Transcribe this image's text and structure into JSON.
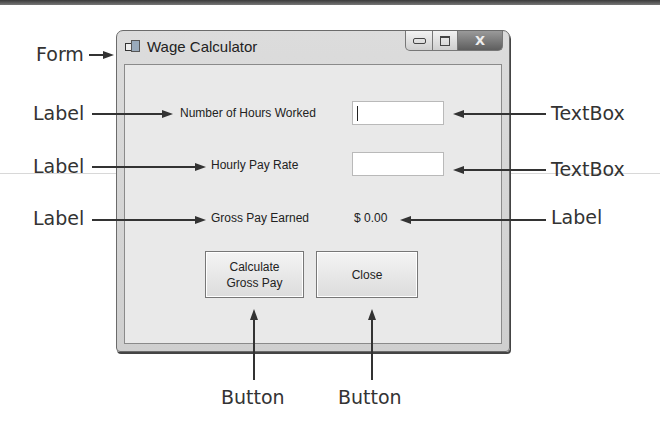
{
  "window": {
    "title": "Wage Calculator",
    "controls": {
      "minimize": "minimize",
      "maximize": "maximize",
      "close": "X"
    }
  },
  "form": {
    "hours_label": "Number of Hours Worked",
    "hours_value": "",
    "rate_label": "Hourly Pay Rate",
    "rate_value": "",
    "gross_label": "Gross Pay Earned",
    "gross_value": "$ 0.00",
    "calculate_button": "Calculate\nGross Pay",
    "close_button": "Close"
  },
  "callouts": {
    "form": "Form",
    "label_hours": "Label",
    "label_rate": "Label",
    "label_gross": "Label",
    "textbox_hours": "TextBox",
    "textbox_rate": "TextBox",
    "label_output": "Label",
    "button_calculate": "Button",
    "button_close": "Button"
  },
  "colors": {
    "arrow": "#333333",
    "window_frame": "#6b6b6b",
    "client_bg": "#e9e9e9"
  }
}
